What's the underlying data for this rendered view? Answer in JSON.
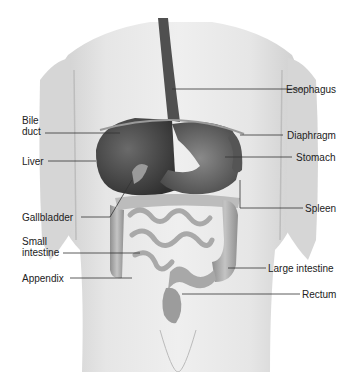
{
  "figure": {
    "labels_left": [
      {
        "id": "bile-duct",
        "lines": [
          "Bile",
          "duct"
        ]
      },
      {
        "id": "liver",
        "lines": [
          "Liver"
        ]
      },
      {
        "id": "gallbladder",
        "lines": [
          "Gallbladder"
        ]
      },
      {
        "id": "small-intestine",
        "lines": [
          "Small",
          "intestine"
        ]
      },
      {
        "id": "appendix",
        "lines": [
          "Appendix"
        ]
      }
    ],
    "labels_right": [
      {
        "id": "esophagus",
        "lines": [
          "Esophagus"
        ]
      },
      {
        "id": "diaphragm",
        "lines": [
          "Diaphragm"
        ]
      },
      {
        "id": "stomach",
        "lines": [
          "Stomach"
        ]
      },
      {
        "id": "spleen",
        "lines": [
          "Spleen"
        ]
      },
      {
        "id": "large-intestine",
        "lines": [
          "Large intestine"
        ]
      },
      {
        "id": "rectum",
        "lines": [
          "Rectum"
        ]
      }
    ]
  },
  "text": {
    "bile": "Bile",
    "duct": "duct",
    "liver": "Liver",
    "gallbladder": "Gallbladder",
    "small": "Small",
    "intestine": "intestine",
    "appendix": "Appendix",
    "esophagus": "Esophagus",
    "diaphragm": "Diaphragm",
    "stomach": "Stomach",
    "spleen": "Spleen",
    "large_intestine": "Large intestine",
    "rectum": "Rectum"
  },
  "colors": {
    "body": "#e4e4e4",
    "body_shadow": "#c8c8c8",
    "organ_dark": "#4a4a4a",
    "organ_mid": "#7a7a7a",
    "intestine": "#c9c9c9",
    "leader_line": "#333333",
    "label_text": "#222222"
  }
}
